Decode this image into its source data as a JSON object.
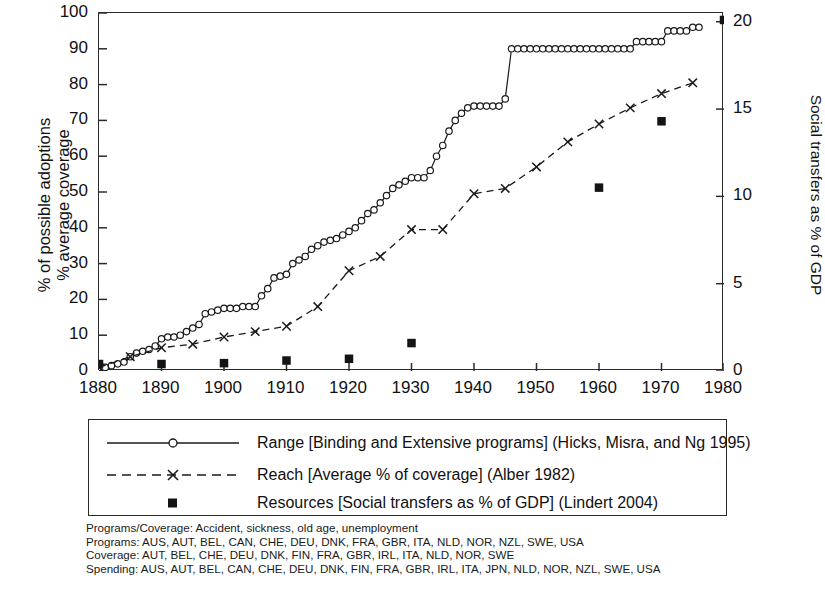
{
  "axes": {
    "left_title": "% of possible adoptions\n% average coverage",
    "right_title": "Social transfers as % of GDP",
    "left_ticks": [
      "0",
      "10",
      "20",
      "30",
      "40",
      "50",
      "60",
      "70",
      "80",
      "90",
      "100"
    ],
    "right_ticks": [
      "0",
      "5",
      "10",
      "15",
      "20"
    ],
    "x_ticks": [
      "1880",
      "1890",
      "1900",
      "1910",
      "1920",
      "1930",
      "1940",
      "1950",
      "1960",
      "1970",
      "1980"
    ]
  },
  "legend": {
    "items": [
      {
        "key": "line-circle-marker",
        "label": "Range [Binding and Extensive programs] (Hicks, Misra, and Ng 1995)"
      },
      {
        "key": "dashed-line-x-marker",
        "label": "Reach [Average % of coverage] (Alber 1982)"
      },
      {
        "key": "filled-square-marker",
        "label": "Resources [Social transfers as % of GDP] (Lindert 2004)"
      }
    ]
  },
  "notes": [
    "Programs/Coverage: Accident, sickness, old age, unemployment",
    "Programs: AUS, AUT, BEL, CAN, CHE, DEU, DNK, FRA, GBR, ITA, NLD, NOR, NZL, SWE, USA",
    "Coverage: AUT, BEL, CHE, DEU, DNK, FIN, FRA, GBR, IRL, ITA, NLD, NOR, SWE",
    "Spending: AUS, AUT, BEL, CAN, CHE, DEU, DNK, FIN, FRA, GBR, IRL, ITA, JPN, NLD, NOR, NZL, SWE, USA"
  ],
  "colors": {
    "ink": "#1a1a1a",
    "frame": "#2b2b2b",
    "background": "#ffffff"
  },
  "chart_data": {
    "type": "line",
    "title": "",
    "xlabel": "",
    "ylabel": "% of possible adoptions / % average coverage",
    "ylabel_right": "Social transfers as % of GDP",
    "xlim": [
      1880,
      1980
    ],
    "ylim": [
      0,
      100
    ],
    "ylim_right": [
      0,
      20.5
    ],
    "grid": false,
    "legend_position": "below-plot",
    "series": [
      {
        "name": "Range [Binding and Extensive programs] (Hicks, Misra, and Ng 1995)",
        "axis": "left",
        "marker": "open-circle",
        "linestyle": "solid",
        "x": [
          1880,
          1881,
          1882,
          1883,
          1884,
          1885,
          1886,
          1887,
          1888,
          1889,
          1890,
          1891,
          1892,
          1893,
          1894,
          1895,
          1896,
          1897,
          1898,
          1899,
          1900,
          1901,
          1902,
          1903,
          1904,
          1905,
          1906,
          1907,
          1908,
          1909,
          1910,
          1911,
          1912,
          1913,
          1914,
          1915,
          1916,
          1917,
          1918,
          1919,
          1920,
          1921,
          1922,
          1923,
          1924,
          1925,
          1926,
          1927,
          1928,
          1929,
          1930,
          1931,
          1932,
          1933,
          1934,
          1935,
          1936,
          1937,
          1938,
          1939,
          1940,
          1941,
          1942,
          1943,
          1944,
          1945,
          1946,
          1947,
          1948,
          1949,
          1950,
          1951,
          1952,
          1953,
          1954,
          1955,
          1956,
          1957,
          1958,
          1959,
          1960,
          1961,
          1962,
          1963,
          1964,
          1965,
          1966,
          1967,
          1968,
          1969,
          1970,
          1971,
          1972,
          1973,
          1974,
          1975,
          1976
        ],
        "y": [
          1,
          1,
          1.5,
          2,
          2.5,
          4,
          5,
          5.5,
          6,
          7,
          9,
          9.5,
          9.5,
          10,
          11,
          12,
          13,
          16,
          16.5,
          17,
          17.5,
          17.5,
          17.5,
          18,
          18,
          18,
          21,
          23,
          26,
          26.5,
          27,
          30,
          31,
          32,
          34,
          35,
          36,
          36.5,
          37,
          38,
          39,
          40,
          42,
          44,
          45,
          47,
          49,
          51,
          52,
          53,
          54,
          54,
          54,
          56,
          60,
          63,
          67,
          70,
          72,
          73.5,
          74,
          74,
          74,
          74,
          74,
          76,
          90,
          90,
          90,
          90,
          90,
          90,
          90,
          90,
          90,
          90,
          90,
          90,
          90,
          90,
          90,
          90,
          90,
          90,
          90,
          90,
          92,
          92,
          92,
          92,
          92,
          95,
          95,
          95,
          95,
          96,
          96
        ]
      },
      {
        "name": "Reach [Average % of coverage] (Alber 1982)",
        "axis": "left",
        "marker": "x",
        "linestyle": "dashed",
        "x": [
          1880,
          1885,
          1890,
          1895,
          1900,
          1905,
          1910,
          1915,
          1920,
          1925,
          1930,
          1935,
          1940,
          1945,
          1950,
          1955,
          1960,
          1965,
          1970,
          1975
        ],
        "y": [
          1,
          4,
          6.5,
          7.5,
          9.5,
          11,
          12.5,
          18,
          28,
          32,
          39.5,
          39.5,
          49.5,
          51,
          57,
          64,
          69,
          73.5,
          77.5,
          80.5
        ]
      },
      {
        "name": "Resources [Social transfers as % of GDP] (Lindert 2004)",
        "axis": "right",
        "marker": "filled-square",
        "linestyle": "none",
        "x": [
          1880,
          1890,
          1900,
          1910,
          1920,
          1930,
          1960,
          1970,
          1980
        ],
        "y": [
          0.4,
          0.4,
          0.45,
          0.6,
          0.7,
          1.6,
          10.5,
          14.3,
          20.1
        ]
      }
    ]
  }
}
